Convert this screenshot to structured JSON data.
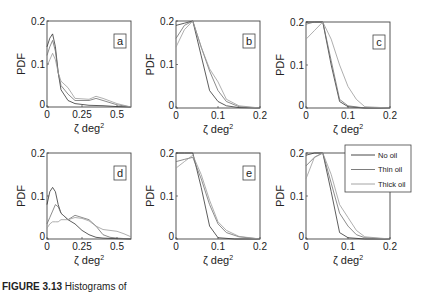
{
  "caption": {
    "label": "FIGURE 3.13",
    "text": "Histograms of"
  },
  "colors": {
    "no_oil": "#333333",
    "thin_oil": "#6e6e6e",
    "thick_oil": "#9a9a9a",
    "axes": "#444444"
  },
  "legend": {
    "entries": [
      "No oil",
      "Thin oil",
      "Thick oil"
    ]
  },
  "chart_data": [
    {
      "type": "line",
      "panel": "a",
      "title": "",
      "xlabel": "ζ deg²",
      "ylabel": "PDF",
      "xlim": [
        0,
        0.6
      ],
      "ylim": [
        0,
        0.2
      ],
      "xticks": [
        0,
        0.25,
        0.5
      ],
      "xtick_labels": [
        "0",
        "0.25",
        "0.5"
      ],
      "yticks": [
        0,
        0.1,
        0.2
      ],
      "ytick_labels": [
        "0",
        "0.1",
        "0.2"
      ],
      "grid": false,
      "series": [
        {
          "name": "No oil",
          "x": [
            0,
            0.02,
            0.04,
            0.06,
            0.08,
            0.1,
            0.15,
            0.2,
            0.3,
            0.4,
            0.5,
            0.6
          ],
          "y": [
            0.14,
            0.16,
            0.17,
            0.14,
            0.08,
            0.04,
            0.015,
            0.008,
            0.004,
            0.003,
            0.001,
            0
          ]
        },
        {
          "name": "Thin oil",
          "x": [
            0,
            0.02,
            0.04,
            0.06,
            0.08,
            0.1,
            0.15,
            0.2,
            0.3,
            0.35,
            0.4,
            0.5,
            0.6
          ],
          "y": [
            0.12,
            0.14,
            0.155,
            0.13,
            0.08,
            0.05,
            0.03,
            0.015,
            0.015,
            0.02,
            0.015,
            0.005,
            0
          ]
        },
        {
          "name": "Thick oil",
          "x": [
            0,
            0.02,
            0.04,
            0.06,
            0.08,
            0.1,
            0.15,
            0.2,
            0.3,
            0.35,
            0.4,
            0.5,
            0.6
          ],
          "y": [
            0.095,
            0.11,
            0.125,
            0.11,
            0.08,
            0.06,
            0.045,
            0.02,
            0.018,
            0.025,
            0.02,
            0.008,
            0
          ]
        }
      ],
      "annotation": "a"
    },
    {
      "type": "line",
      "panel": "b",
      "xlabel": "ζ deg²",
      "ylabel": "PDF",
      "xlim": [
        0,
        0.2
      ],
      "ylim": [
        0,
        0.2
      ],
      "xticks": [
        0,
        0.1,
        0.2
      ],
      "xtick_labels": [
        "0",
        "0.1",
        "0.2"
      ],
      "yticks": [
        0,
        0.1,
        0.2
      ],
      "ytick_labels": [
        "0",
        "0.1",
        "0.2"
      ],
      "grid": false,
      "series": [
        {
          "name": "No oil",
          "x": [
            0,
            0.02,
            0.04,
            0.06,
            0.08,
            0.1,
            0.12,
            0.15,
            0.2
          ],
          "y": [
            0.19,
            0.195,
            0.2,
            0.12,
            0.04,
            0.015,
            0.005,
            0.001,
            0
          ]
        },
        {
          "name": "Thin oil",
          "x": [
            0,
            0.02,
            0.04,
            0.06,
            0.08,
            0.1,
            0.12,
            0.15,
            0.2
          ],
          "y": [
            0.16,
            0.19,
            0.2,
            0.14,
            0.085,
            0.04,
            0.015,
            0.003,
            0
          ]
        },
        {
          "name": "Thick oil",
          "x": [
            0,
            0.02,
            0.04,
            0.06,
            0.08,
            0.1,
            0.12,
            0.15,
            0.2
          ],
          "y": [
            0.14,
            0.18,
            0.2,
            0.14,
            0.09,
            0.06,
            0.02,
            0.005,
            0
          ]
        }
      ],
      "annotation": "b"
    },
    {
      "type": "line",
      "panel": "c",
      "xlabel": "ζ deg²",
      "ylabel": "PDF",
      "xlim": [
        0,
        0.2
      ],
      "ylim": [
        0,
        0.2
      ],
      "xticks": [
        0,
        0.1,
        0.2
      ],
      "xtick_labels": [
        "0",
        "0.1",
        "0.2"
      ],
      "yticks": [
        0,
        0.1,
        0.2
      ],
      "ytick_labels": [
        "0",
        "0.1",
        "0.2"
      ],
      "grid": false,
      "series": [
        {
          "name": "No oil",
          "x": [
            0,
            0.02,
            0.04,
            0.06,
            0.08,
            0.1,
            0.14,
            0.2
          ],
          "y": [
            0.2,
            0.2,
            0.2,
            0.1,
            0.015,
            0.003,
            0,
            0
          ]
        },
        {
          "name": "Thin oil",
          "x": [
            0,
            0.02,
            0.04,
            0.06,
            0.08,
            0.1,
            0.14,
            0.2
          ],
          "y": [
            0.195,
            0.2,
            0.2,
            0.11,
            0.02,
            0.005,
            0,
            0
          ]
        },
        {
          "name": "Thick oil",
          "x": [
            0,
            0.02,
            0.04,
            0.06,
            0.08,
            0.1,
            0.12,
            0.14,
            0.2
          ],
          "y": [
            0.16,
            0.18,
            0.2,
            0.16,
            0.1,
            0.05,
            0.02,
            0.003,
            0
          ]
        }
      ],
      "annotation": "c"
    },
    {
      "type": "line",
      "panel": "d",
      "xlabel": "ζ deg²",
      "ylabel": "PDF",
      "xlim": [
        0,
        0.6
      ],
      "ylim": [
        0,
        0.2
      ],
      "xticks": [
        0,
        0.25,
        0.5
      ],
      "xtick_labels": [
        "0",
        "0.25",
        "0.5"
      ],
      "yticks": [
        0,
        0.1,
        0.2
      ],
      "ytick_labels": [
        "0",
        "0.1",
        "0.2"
      ],
      "grid": false,
      "series": [
        {
          "name": "No oil",
          "x": [
            0,
            0.02,
            0.04,
            0.06,
            0.08,
            0.1,
            0.15,
            0.2,
            0.25,
            0.3,
            0.35,
            0.4,
            0.5,
            0.6
          ],
          "y": [
            0.08,
            0.11,
            0.12,
            0.11,
            0.08,
            0.06,
            0.045,
            0.035,
            0.02,
            0.01,
            0.004,
            0.002,
            0.001,
            0
          ]
        },
        {
          "name": "Thin oil",
          "x": [
            0,
            0.02,
            0.04,
            0.06,
            0.08,
            0.1,
            0.15,
            0.2,
            0.25,
            0.3,
            0.35,
            0.4,
            0.45,
            0.5,
            0.6
          ],
          "y": [
            0.035,
            0.05,
            0.065,
            0.08,
            0.075,
            0.06,
            0.045,
            0.055,
            0.05,
            0.045,
            0.03,
            0.01,
            0.004,
            0.002,
            0
          ]
        },
        {
          "name": "Thick oil",
          "x": [
            0,
            0.02,
            0.04,
            0.06,
            0.08,
            0.1,
            0.15,
            0.2,
            0.25,
            0.3,
            0.35,
            0.4,
            0.45,
            0.5,
            0.55,
            0.6
          ],
          "y": [
            0.025,
            0.035,
            0.04,
            0.04,
            0.04,
            0.045,
            0.045,
            0.05,
            0.048,
            0.042,
            0.03,
            0.022,
            0.02,
            0.018,
            0.012,
            0.005
          ]
        }
      ],
      "annotation": "d"
    },
    {
      "type": "line",
      "panel": "e",
      "xlabel": "ζ deg²",
      "ylabel": "PDF",
      "xlim": [
        0,
        0.2
      ],
      "ylim": [
        0,
        0.2
      ],
      "xticks": [
        0,
        0.1,
        0.2
      ],
      "xtick_labels": [
        "0",
        "0.1",
        "0.2"
      ],
      "yticks": [
        0,
        0.1,
        0.2
      ],
      "ytick_labels": [
        "0",
        "0.1",
        "0.2"
      ],
      "grid": false,
      "series": [
        {
          "name": "No oil",
          "x": [
            0,
            0.02,
            0.04,
            0.06,
            0.08,
            0.1,
            0.14,
            0.2
          ],
          "y": [
            0.2,
            0.2,
            0.2,
            0.12,
            0.03,
            0.003,
            0,
            0
          ]
        },
        {
          "name": "Thin oil",
          "x": [
            0,
            0.02,
            0.04,
            0.06,
            0.08,
            0.1,
            0.12,
            0.15,
            0.2
          ],
          "y": [
            0.18,
            0.185,
            0.19,
            0.14,
            0.08,
            0.035,
            0.015,
            0.005,
            0
          ]
        },
        {
          "name": "Thick oil",
          "x": [
            0,
            0.02,
            0.04,
            0.06,
            0.08,
            0.1,
            0.12,
            0.15,
            0.2
          ],
          "y": [
            0.165,
            0.18,
            0.195,
            0.15,
            0.09,
            0.04,
            0.02,
            0.006,
            0
          ]
        }
      ],
      "annotation": "e"
    },
    {
      "type": "line",
      "panel": "f",
      "xlabel": "ζ deg²",
      "ylabel": "PDF",
      "xlim": [
        0,
        0.2
      ],
      "ylim": [
        0,
        0.2
      ],
      "xticks": [
        0,
        0.1,
        0.2
      ],
      "xtick_labels": [
        "0",
        "0.1",
        "0.2"
      ],
      "yticks": [
        0,
        0.1,
        0.2
      ],
      "ytick_labels": [
        "0",
        "0.1",
        "0.2"
      ],
      "grid": false,
      "series": [
        {
          "name": "No oil",
          "x": [
            0,
            0.02,
            0.04,
            0.06,
            0.08,
            0.1,
            0.14,
            0.2
          ],
          "y": [
            0.195,
            0.2,
            0.2,
            0.11,
            0.015,
            0.003,
            0,
            0
          ]
        },
        {
          "name": "Thin oil",
          "x": [
            0,
            0.02,
            0.04,
            0.06,
            0.08,
            0.1,
            0.12,
            0.14,
            0.2
          ],
          "y": [
            0.17,
            0.19,
            0.2,
            0.13,
            0.06,
            0.03,
            0.01,
            0.003,
            0
          ]
        },
        {
          "name": "Thick oil",
          "x": [
            0,
            0.02,
            0.04,
            0.06,
            0.08,
            0.1,
            0.12,
            0.14,
            0.2
          ],
          "y": [
            0.14,
            0.19,
            0.2,
            0.15,
            0.08,
            0.05,
            0.02,
            0.005,
            0
          ]
        }
      ],
      "annotation": "f",
      "legend": {
        "position": "upper right",
        "entries": [
          "No oil",
          "Thin oil",
          "Thick oil"
        ]
      }
    }
  ]
}
